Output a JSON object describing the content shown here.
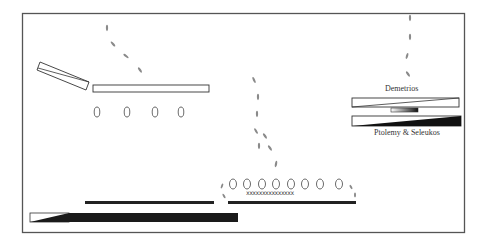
{
  "diagram": {
    "type": "battle-plan",
    "frame": {
      "x": 22,
      "y": 13,
      "w": 443,
      "h": 220,
      "stroke": "#555555"
    },
    "labels": [
      {
        "id": "demetrios",
        "text": "Demetrios",
        "x": 385,
        "y": 84
      },
      {
        "id": "ptolemy-seleukos",
        "text": "Ptolemy & Seleukos",
        "x": 374,
        "y": 128
      }
    ],
    "colors": {
      "line": "#222222",
      "fill_dark": "#1a1a1a",
      "footprint": "#888888",
      "frame": "#555555"
    },
    "units": {
      "left_tilted_block": {
        "desc": "tilted outlined block (upper left)"
      },
      "upper_left_line": {
        "desc": "outlined rectangle",
        "x": 93,
        "y": 85,
        "w": 116,
        "h": 7
      },
      "upper_left_circles": {
        "count": 4,
        "y": 112,
        "xs": [
          97,
          127,
          155,
          181
        ]
      },
      "center_circles": {
        "count": 8,
        "y": 184,
        "xs": [
          233,
          247,
          262,
          276,
          291,
          305,
          320,
          339
        ]
      },
      "center_crosses": {
        "text": "xxxxxxxxxxxxxxx",
        "x": 246,
        "y": 191
      },
      "center_line": {
        "x": 228,
        "y": 201,
        "w": 128,
        "h": 3
      },
      "bottom_left_line": {
        "x": 85,
        "y": 201,
        "w": 129,
        "h": 3
      },
      "bottom_block": {
        "x": 29,
        "y": 213,
        "w": 209,
        "h": 9
      },
      "demetrios_block_top": {
        "x": 352,
        "y": 98,
        "w": 107,
        "h": 9
      },
      "demetrios_block_mid": {
        "x": 391,
        "y": 108,
        "w": 27,
        "h": 4
      },
      "ptolemy_block": {
        "x": 352,
        "y": 116,
        "w": 109,
        "h": 10
      }
    },
    "movement_tracks": [
      {
        "id": "track-left",
        "points": [
          [
            107,
            28
          ],
          [
            112,
            45
          ],
          [
            127,
            58
          ],
          [
            140,
            72
          ]
        ]
      },
      {
        "id": "track-center",
        "points": [
          [
            257,
            72
          ],
          [
            260,
            89
          ],
          [
            259,
            105
          ],
          [
            255,
            124
          ],
          [
            259,
            137
          ],
          [
            270,
            148
          ],
          [
            277,
            163
          ]
        ]
      },
      {
        "id": "track-right",
        "points": [
          [
            409,
            17
          ],
          [
            410,
            37
          ],
          [
            408,
            56
          ],
          [
            411,
            73
          ]
        ]
      },
      {
        "id": "track-center-left",
        "points": [
          [
            222,
            186
          ],
          [
            224,
            196
          ]
        ]
      },
      {
        "id": "track-center-right",
        "points": [
          [
            350,
            186
          ],
          [
            354,
            195
          ]
        ]
      }
    ]
  }
}
